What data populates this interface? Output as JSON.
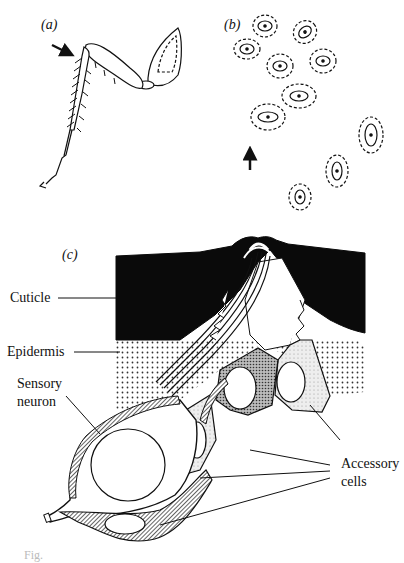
{
  "figure": {
    "panels": [
      {
        "id": "a",
        "label": "(a)",
        "content": "insect leg with arrow indicating hair-plate location"
      },
      {
        "id": "b",
        "label": "(b)",
        "content": "top view of campaniform sensilla (ellipses) with arrow"
      },
      {
        "id": "c",
        "label": "(c)",
        "content": "section through campaniform sensillum"
      }
    ],
    "labels": {
      "panel_a": "(a)",
      "panel_b": "(b)",
      "panel_c": "(c)",
      "cuticle": "Cuticle",
      "epidermis": "Epidermis",
      "sensory_neuron_line1": "Sensory",
      "sensory_neuron_line2": "neuron",
      "accessory_line1": "Accessory",
      "accessory_line2": "cells"
    },
    "caption": "Fig."
  },
  "colors": {
    "ink": "#111111",
    "background": "#ffffff",
    "cuticle_fill": "#0a0a0a"
  }
}
